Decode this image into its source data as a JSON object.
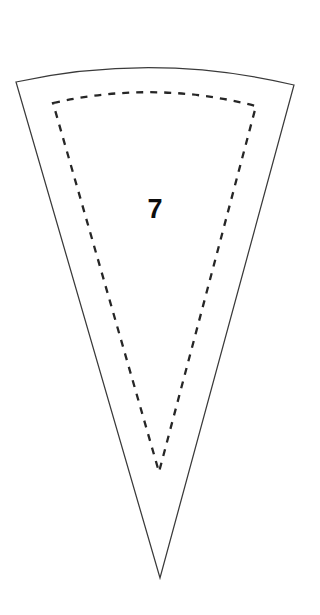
{
  "page": {
    "background_color": "#ffffff",
    "width": 320,
    "height": 615
  },
  "shape": {
    "kind": "circular-sector-wedge",
    "label": "7",
    "outline": {
      "stroke_color": "#3a3a3a",
      "stroke_width": 1.25,
      "style": "solid",
      "fill": "#ffffff",
      "apex": {
        "x": 160,
        "y": 578
      },
      "top_left": {
        "x": 16,
        "y": 82
      },
      "top_right": {
        "x": 294,
        "y": 85
      },
      "arc_peak": {
        "x": 155,
        "y": 65
      },
      "path": "M 16 82 Q 155 52 294 85 L 160 578 Z"
    },
    "seam_allowance": {
      "stroke_color": "#262626",
      "stroke_width": 2.3,
      "style": "dashed",
      "dash_pattern": "7 7",
      "apex": {
        "x": 159,
        "y": 472
      },
      "top_left": {
        "x": 53,
        "y": 103
      },
      "top_right": {
        "x": 256,
        "y": 106
      },
      "arc_peak": {
        "x": 155,
        "y": 93
      },
      "path": "M 53 103 Q 155 80 256 106 L 159 472 Z"
    },
    "number_label": {
      "text": "7",
      "x": 155,
      "y": 218,
      "font_size": 27,
      "font_weight": "bold",
      "color": "#0d0d0d"
    }
  }
}
